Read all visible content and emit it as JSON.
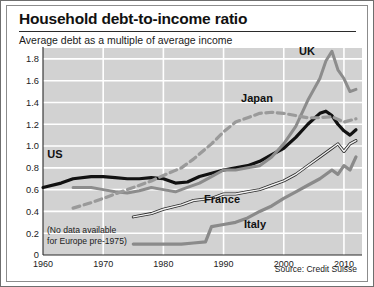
{
  "header": {
    "title": "Household debt-to-income ratio",
    "subtitle": "Average debt as a multiple of average income"
  },
  "footer": {
    "source": "Source: Credit Suisse"
  },
  "annotation": {
    "line1": "(No data available",
    "line2": "for Europe pre-1975)"
  },
  "series_labels": {
    "uk": "UK",
    "japan": "Japan",
    "us": "US",
    "france": "France",
    "italy": "Italy"
  },
  "colors": {
    "plot_background": "#d2d2d2",
    "gridline": "#ffffff",
    "us_line": "#111111",
    "uk_line": "#8c8c8c",
    "japan_line": "#9a9a9a",
    "italy_line": "#8a8a8a",
    "france_line": "#f2f2f2",
    "france_outline": "#2b2b2b",
    "axis": "#2b2b2b",
    "text": "#1a1a1a"
  },
  "chart_data": {
    "type": "line",
    "title": "Household debt-to-income ratio",
    "subtitle": "Average debt as a multiple of average income",
    "xlabel": "",
    "ylabel": "Average debt as a multiple of average income",
    "xlim": [
      1960,
      2013
    ],
    "ylim": [
      0,
      1.9
    ],
    "ytick_labels": [
      "0",
      "0.2",
      "0.4",
      "0.6",
      "0.8",
      "1.0",
      "1.2",
      "1.4",
      "1.6",
      "1.8"
    ],
    "yticks": [
      0,
      0.2,
      0.4,
      0.6,
      0.8,
      1.0,
      1.2,
      1.4,
      1.6,
      1.8
    ],
    "xtick_labels": [
      "1960",
      "1970",
      "1980",
      "1990",
      "2000",
      "2010"
    ],
    "xticks": [
      1960,
      1970,
      1980,
      1990,
      2000,
      2010
    ],
    "grid": true,
    "legend": "inline-labels",
    "note": "(No data available for Europe pre-1975)",
    "source": "Source: Credit Suisse",
    "series": [
      {
        "name": "US",
        "style": "solid-thick-black",
        "x": [
          1960,
          1963,
          1965,
          1968,
          1970,
          1972,
          1974,
          1976,
          1978,
          1980,
          1982,
          1984,
          1986,
          1988,
          1990,
          1992,
          1994,
          1996,
          1998,
          2000,
          2002,
          2004,
          2006,
          2007,
          2008,
          2009,
          2010,
          2011,
          2012
        ],
        "values": [
          0.62,
          0.66,
          0.7,
          0.72,
          0.72,
          0.71,
          0.7,
          0.7,
          0.71,
          0.7,
          0.66,
          0.67,
          0.72,
          0.75,
          0.78,
          0.8,
          0.82,
          0.86,
          0.92,
          0.98,
          1.08,
          1.2,
          1.3,
          1.32,
          1.28,
          1.2,
          1.14,
          1.1,
          1.15
        ]
      },
      {
        "name": "UK",
        "style": "solid-gray",
        "x": [
          1965,
          1968,
          1970,
          1972,
          1974,
          1976,
          1978,
          1980,
          1982,
          1984,
          1986,
          1988,
          1990,
          1992,
          1994,
          1996,
          1998,
          2000,
          2002,
          2004,
          2006,
          2007,
          2008,
          2009,
          2010,
          2011,
          2012
        ],
        "values": [
          0.62,
          0.62,
          0.6,
          0.58,
          0.57,
          0.59,
          0.62,
          0.6,
          0.58,
          0.62,
          0.66,
          0.72,
          0.78,
          0.78,
          0.8,
          0.82,
          0.9,
          1.02,
          1.18,
          1.42,
          1.62,
          1.78,
          1.87,
          1.7,
          1.62,
          1.5,
          1.52
        ]
      },
      {
        "name": "Japan",
        "style": "dashed-gray",
        "x": [
          1965,
          1968,
          1970,
          1973,
          1975,
          1978,
          1980,
          1983,
          1985,
          1988,
          1990,
          1992,
          1994,
          1996,
          1998,
          2000,
          2002,
          2004,
          2006,
          2008,
          2010,
          2012
        ],
        "values": [
          0.43,
          0.48,
          0.52,
          0.58,
          0.62,
          0.68,
          0.73,
          0.8,
          0.88,
          1.02,
          1.13,
          1.22,
          1.26,
          1.3,
          1.31,
          1.3,
          1.28,
          1.26,
          1.26,
          1.27,
          1.22,
          1.25
        ]
      },
      {
        "name": "France",
        "style": "thin-outlined",
        "x": [
          1975,
          1978,
          1980,
          1983,
          1985,
          1988,
          1990,
          1992,
          1994,
          1996,
          1998,
          2000,
          2002,
          2004,
          2006,
          2008,
          2009,
          2010,
          2011,
          2012
        ],
        "values": [
          0.35,
          0.38,
          0.42,
          0.46,
          0.5,
          0.52,
          0.56,
          0.56,
          0.58,
          0.6,
          0.64,
          0.68,
          0.74,
          0.82,
          0.9,
          0.98,
          1.02,
          0.95,
          1.02,
          1.05
        ]
      },
      {
        "name": "Italy",
        "style": "solid-medium-gray",
        "x": [
          1975,
          1978,
          1980,
          1983,
          1985,
          1987,
          1988,
          1990,
          1992,
          1994,
          1996,
          1998,
          2000,
          2002,
          2004,
          2006,
          2008,
          2009,
          2010,
          2011,
          2012
        ],
        "values": [
          0.1,
          0.1,
          0.1,
          0.1,
          0.11,
          0.12,
          0.26,
          0.28,
          0.3,
          0.34,
          0.4,
          0.45,
          0.52,
          0.58,
          0.64,
          0.7,
          0.78,
          0.74,
          0.82,
          0.78,
          0.9
        ]
      }
    ]
  }
}
